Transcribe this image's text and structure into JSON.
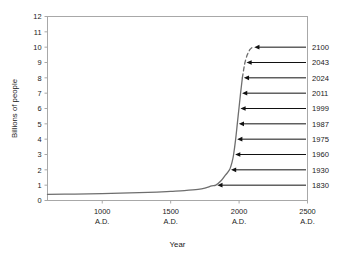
{
  "chart_data": {
    "type": "line",
    "title": "",
    "xlabel": "Year",
    "ylabel": "Billions of people",
    "xlim": [
      600,
      2500
    ],
    "ylim": [
      0,
      12
    ],
    "grid": false,
    "legend": "none",
    "x_tick_labels": [
      "1000",
      "1500",
      "2000",
      "2500"
    ],
    "x_tick_sublabels": [
      "A.D.",
      "A.D.",
      "A.D.",
      "A.D."
    ],
    "x_tick_values": [
      1000,
      1500,
      2000,
      2500
    ],
    "y_tick_labels": [
      "0",
      "1",
      "2",
      "3",
      "4",
      "5",
      "6",
      "7",
      "8",
      "9",
      "10",
      "11",
      "12"
    ],
    "y_tick_values": [
      0,
      1,
      2,
      3,
      4,
      5,
      6,
      7,
      8,
      9,
      10,
      11,
      12
    ],
    "series": [
      {
        "name": "World population (historical)",
        "style": "solid",
        "x": [
          600,
          800,
          1000,
          1200,
          1400,
          1500,
          1600,
          1700,
          1750,
          1800,
          1830,
          1870,
          1900,
          1930,
          1950,
          1960,
          1975,
          1987,
          1999,
          2011,
          2024
        ],
        "values": [
          0.4,
          0.42,
          0.45,
          0.5,
          0.55,
          0.6,
          0.65,
          0.72,
          0.8,
          0.95,
          1.0,
          1.3,
          1.65,
          2.0,
          2.55,
          3.0,
          4.0,
          5.0,
          6.0,
          7.0,
          8.0
        ]
      },
      {
        "name": "World population (projected)",
        "style": "dashed",
        "x": [
          2024,
          2033,
          2043,
          2060,
          2080,
          2100
        ],
        "values": [
          8.0,
          8.5,
          9.0,
          9.5,
          9.85,
          10.0
        ]
      }
    ],
    "annotations": [
      {
        "label": "2100",
        "year": 2100,
        "population": 10.0
      },
      {
        "label": "2043",
        "year": 2043,
        "population": 9.0
      },
      {
        "label": "2024",
        "year": 2024,
        "population": 8.0
      },
      {
        "label": "2011",
        "year": 2011,
        "population": 7.0
      },
      {
        "label": "1999",
        "year": 1999,
        "population": 6.0
      },
      {
        "label": "1987",
        "year": 1987,
        "population": 5.0
      },
      {
        "label": "1975",
        "year": 1975,
        "population": 4.0
      },
      {
        "label": "1960",
        "year": 1960,
        "population": 3.0
      },
      {
        "label": "1930",
        "year": 1930,
        "population": 2.0
      },
      {
        "label": "1830",
        "year": 1830,
        "population": 1.0
      }
    ],
    "colors": {
      "curve": "#6e6e6e",
      "axis": "#a8a8a8",
      "annotation": "#111111",
      "text": "#1a1a1a",
      "background": "#ffffff"
    }
  }
}
